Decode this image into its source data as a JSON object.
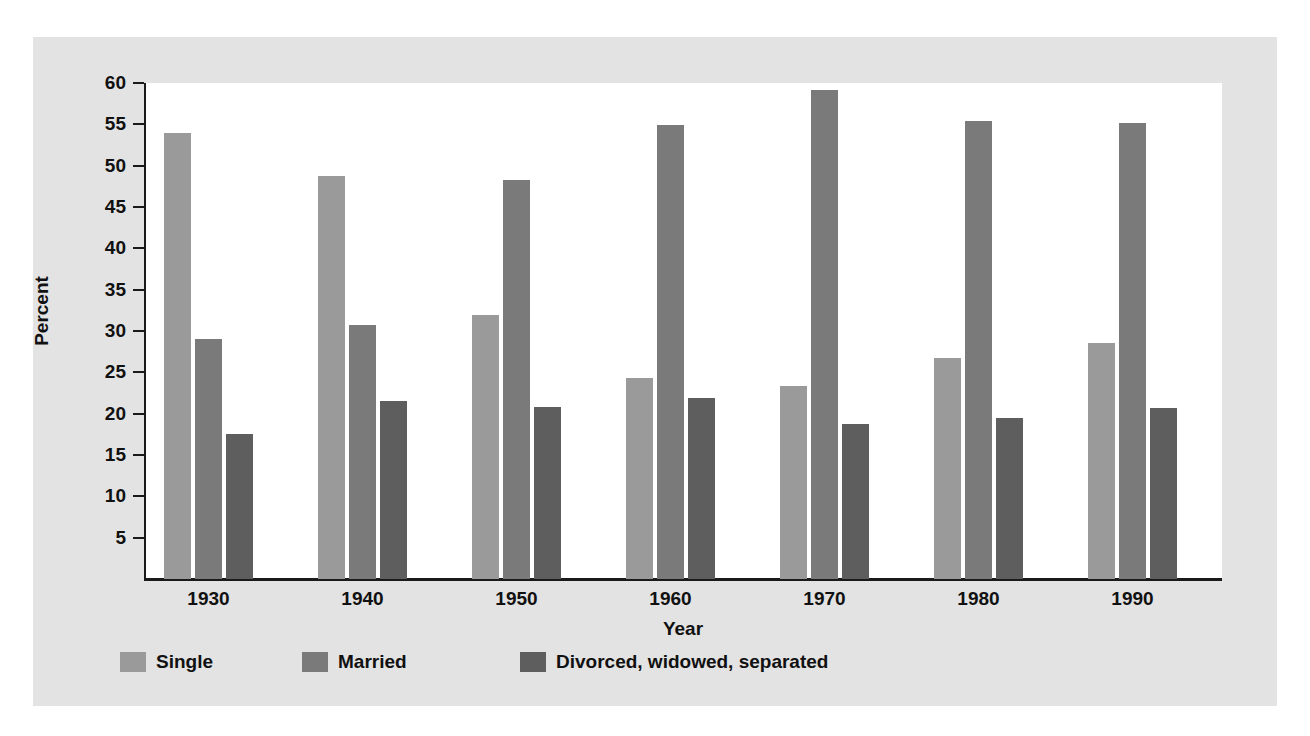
{
  "chart_data": {
    "type": "bar",
    "title": "",
    "subtitle": "",
    "xlabel": "Year",
    "ylabel": "Percent",
    "categories": [
      "1930",
      "1940",
      "1950",
      "1960",
      "1970",
      "1980",
      "1990"
    ],
    "series": [
      {
        "name": "Single",
        "color": "#9a9a9a",
        "values": [
          53.9,
          48.7,
          31.9,
          24.3,
          23.4,
          26.7,
          28.6
        ]
      },
      {
        "name": "Married",
        "color": "#7a7a7a",
        "values": [
          29.0,
          30.7,
          48.3,
          54.9,
          59.2,
          55.4,
          55.2
        ]
      },
      {
        "name": "Divorced, widowed, separated",
        "color": "#5e5e5e",
        "values": [
          17.6,
          21.5,
          20.8,
          21.9,
          18.8,
          19.5,
          20.7
        ]
      }
    ],
    "ylim": [
      0,
      60
    ],
    "yticks": [
      5,
      10,
      15,
      20,
      25,
      30,
      35,
      40,
      45,
      50,
      55,
      60
    ],
    "ytick_labels": [
      "5",
      "10",
      "15",
      "20",
      "25",
      "30",
      "35",
      "40",
      "45",
      "50",
      "55",
      "60"
    ],
    "grid": false,
    "legend_position": "bottom-left"
  },
  "legend": {
    "entries": [
      {
        "label": "Single",
        "color": "#9a9a9a"
      },
      {
        "label": "Married",
        "color": "#7a7a7a"
      },
      {
        "label": "Divorced, widowed, separated",
        "color": "#5e5e5e"
      }
    ]
  },
  "colors": {
    "figure_background": "#e3e3e3",
    "plot_background": "#ffffff",
    "axis": "#1a1a1a",
    "text": "#111111"
  }
}
